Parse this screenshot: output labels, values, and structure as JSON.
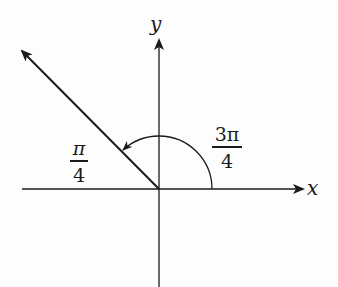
{
  "diagram": {
    "axes": {
      "x_label": "x",
      "y_label": "y"
    },
    "ray": {
      "angle_label": "3π/4",
      "reference_angle_label": "π/4"
    },
    "labels": {
      "angle_numerator": "3π",
      "angle_denominator": "4",
      "ref_numerator": "π",
      "ref_denominator": "4"
    },
    "colors": {
      "stroke": "#1a1a1a",
      "background": "#fdfdfd"
    }
  }
}
